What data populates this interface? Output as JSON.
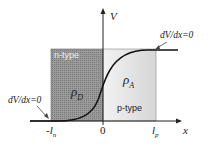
{
  "diagram": {
    "axes": {
      "y_label": "V",
      "x_label": "x"
    },
    "ticks": {
      "left": "-l",
      "left_sub": "n",
      "origin": "0",
      "right": "l",
      "right_sub": "p"
    },
    "regions": {
      "n_type": {
        "label": "n-type",
        "charge": "ρ",
        "charge_sub": "D",
        "color": "#8a8a8a"
      },
      "p_type": {
        "label": "p-type",
        "charge": "ρ",
        "charge_sub": "A",
        "color": "#e2e2e2"
      }
    },
    "annotations": {
      "top_right": "dV/dx=0",
      "bottom_left": "dV/dx=0"
    }
  }
}
